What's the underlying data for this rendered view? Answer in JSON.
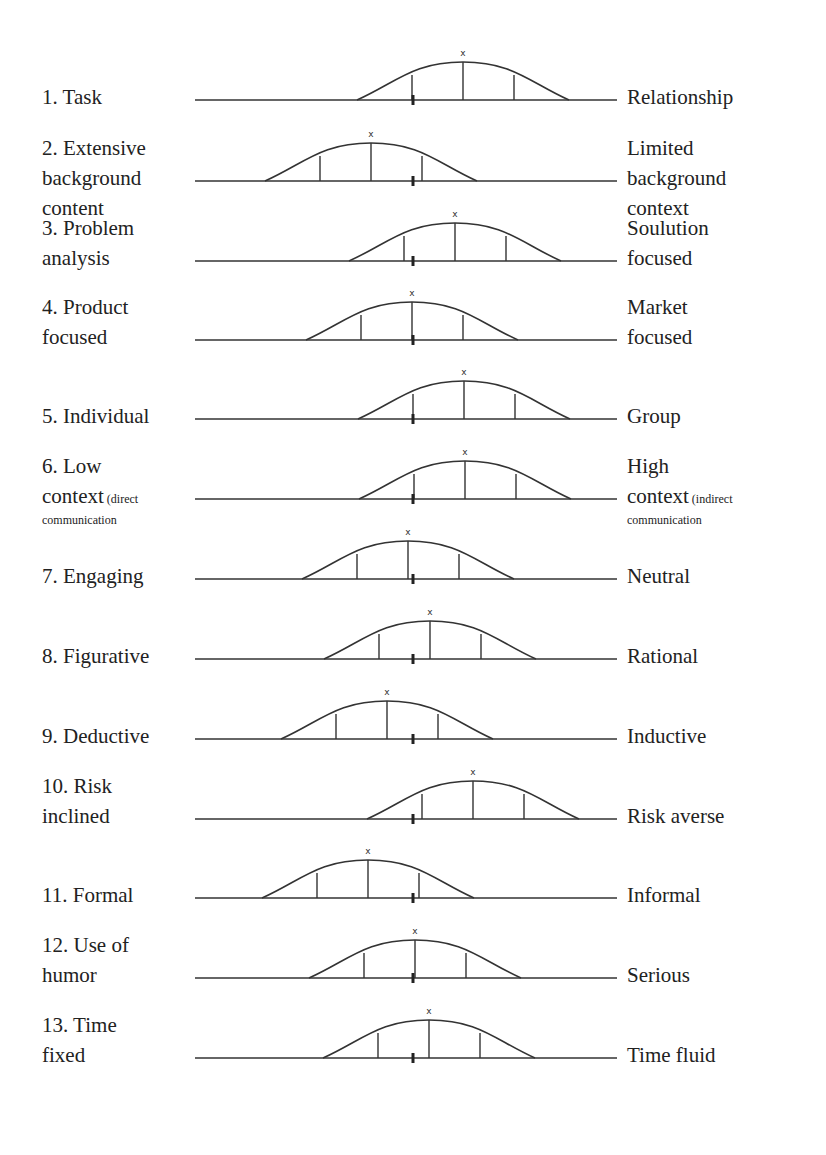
{
  "rows": [
    {
      "left": [
        "1. Task"
      ],
      "right": [
        "Relationship"
      ],
      "y": 100,
      "peak": 463
    },
    {
      "left": [
        "2. Extensive",
        "background",
        "content"
      ],
      "right": [
        "Limited",
        "background",
        "context"
      ],
      "y": 181,
      "peak": 371
    },
    {
      "left": [
        "3. Problem",
        "analysis"
      ],
      "right": [
        "Soulution",
        "focused"
      ],
      "y": 261,
      "peak": 455
    },
    {
      "left": [
        "4. Product",
        "focused"
      ],
      "right": [
        "Market",
        "focused"
      ],
      "y": 340,
      "peak": 412
    },
    {
      "left": [
        "5. Individual"
      ],
      "right": [
        "Group"
      ],
      "y": 419,
      "peak": 464
    },
    {
      "left": [
        "6. Low",
        "context"
      ],
      "left_small": [
        "(direct",
        "communication"
      ],
      "right": [
        "High",
        "context"
      ],
      "right_small": [
        "(indirect",
        "communication"
      ],
      "y": 499,
      "peak": 465
    },
    {
      "left": [
        "7. Engaging"
      ],
      "right": [
        "Neutral"
      ],
      "y": 579,
      "peak": 408
    },
    {
      "left": [
        "8. Figurative"
      ],
      "right": [
        "Rational"
      ],
      "y": 659,
      "peak": 430
    },
    {
      "left": [
        "9. Deductive"
      ],
      "right": [
        "Inductive"
      ],
      "y": 739,
      "peak": 387
    },
    {
      "left": [
        "10. Risk",
        "inclined"
      ],
      "right": [
        "Risk averse"
      ],
      "y": 819,
      "peak": 473
    },
    {
      "left": [
        "11. Formal"
      ],
      "right": [
        "Informal"
      ],
      "y": 898,
      "peak": 368
    },
    {
      "left": [
        "12. Use of",
        "humor"
      ],
      "right": [
        "Serious"
      ],
      "y": 978,
      "peak": 415
    },
    {
      "left": [
        "13. Time",
        "fixed"
      ],
      "right": [
        "Time fluid"
      ],
      "y": 1058,
      "peak": 429
    }
  ],
  "center_x": 413,
  "peak_marker": "x"
}
